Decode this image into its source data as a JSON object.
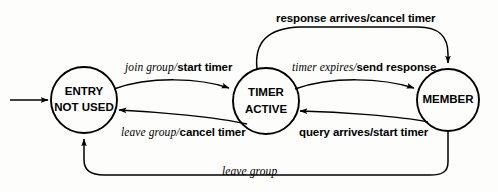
{
  "diagram": {
    "type": "state-transition-diagram",
    "line_color": "#000000",
    "background_color": "#fdfdfc",
    "states": [
      {
        "id": "entry-not-used",
        "line1": "ENTRY",
        "line2": "NOT USED",
        "cx": 84,
        "cy": 100,
        "r": 33
      },
      {
        "id": "timer-active",
        "line1": "TIMER",
        "line2": "ACTIVE",
        "cx": 266,
        "cy": 101,
        "r": 33
      },
      {
        "id": "member",
        "line1": "MEMBER",
        "line2": "",
        "cx": 448,
        "cy": 100,
        "r": 31
      }
    ],
    "transitions": [
      {
        "id": "initial",
        "from": "",
        "to": "entry-not-used",
        "event": "",
        "action": "",
        "style": "initial-arrow"
      },
      {
        "id": "join-group",
        "from": "entry-not-used",
        "to": "timer-active",
        "event": "join group",
        "separator": "/",
        "action": "start timer",
        "style": "italic-event-bold-action"
      },
      {
        "id": "leave-group-cancel-timer",
        "from": "timer-active",
        "to": "entry-not-used",
        "event": "leave group",
        "separator": "/",
        "action": "cancel timer",
        "style": "italic-event-bold-action"
      },
      {
        "id": "timer-expires",
        "from": "timer-active",
        "to": "member",
        "event": "timer expires",
        "separator": "/",
        "action": "send response",
        "style": "italic-event-bold-action"
      },
      {
        "id": "query-arrives",
        "from": "member",
        "to": "timer-active",
        "event": "query arrives",
        "separator": "/",
        "action": "start timer",
        "style": "all-bold"
      },
      {
        "id": "response-arrives",
        "from": "timer-active",
        "to": "member",
        "event": "response arrives",
        "separator": "/",
        "action": "cancel timer",
        "style": "all-bold"
      },
      {
        "id": "leave-group",
        "from": "member",
        "to": "entry-not-used",
        "event": "leave group",
        "separator": "",
        "action": "",
        "style": "all-italic"
      }
    ]
  }
}
